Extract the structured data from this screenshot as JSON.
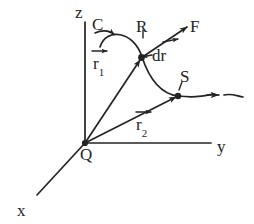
{
  "figure": {
    "type": "vector-diagram",
    "background_color": "#ffffff",
    "ink_color": "#242424"
  },
  "axes": {
    "x": {
      "label": "x",
      "label_x": 17,
      "label_y": 202
    },
    "y": {
      "label": "y",
      "label_x": 217,
      "label_y": 138
    },
    "z": {
      "label": "z",
      "label_x": 75,
      "label_y": 4
    },
    "origin": {
      "label": "Q",
      "label_x": 80,
      "label_y": 146
    }
  },
  "curve": {
    "label": "C",
    "label_x": 92,
    "label_y": 16
  },
  "points": [
    {
      "name": "R",
      "label": "R",
      "label_x": 136,
      "label_y": 18
    },
    {
      "name": "S",
      "label": "S",
      "label_x": 180,
      "label_y": 68
    }
  ],
  "vectors": [
    {
      "name": "r1",
      "base": "r",
      "subscript": "1",
      "label_x": 93,
      "label_y": 55
    },
    {
      "name": "r2",
      "base": "r",
      "subscript": "2",
      "label_x": 136,
      "label_y": 116
    },
    {
      "name": "F",
      "base": "F",
      "subscript": "",
      "label_x": 190,
      "label_y": 18
    },
    {
      "name": "dr",
      "base": "dr",
      "subscript": "",
      "label_x": 152,
      "label_y": 47
    }
  ]
}
